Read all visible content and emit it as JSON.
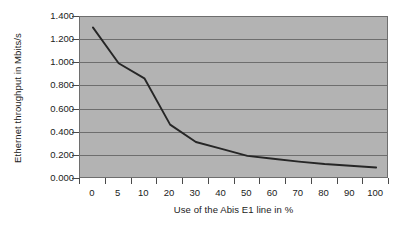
{
  "chart_data": {
    "type": "line",
    "title": "",
    "xlabel": "Use of the Abis E1 line in %",
    "ylabel": "Ethernet throughput in Mbits/s",
    "categories": [
      "0",
      "5",
      "10",
      "20",
      "30",
      "40",
      "50",
      "60",
      "70",
      "80",
      "90",
      "100"
    ],
    "series": [
      {
        "name": "Ethernet throughput",
        "values": [
          1.31,
          1.0,
          0.87,
          0.47,
          0.32,
          0.26,
          0.2,
          0.175,
          0.15,
          0.13,
          0.115,
          0.1
        ]
      }
    ],
    "x_tick_labels": [
      "0",
      "5",
      "10",
      "20",
      "30",
      "40",
      "50",
      "60",
      "70",
      "80",
      "90",
      "100"
    ],
    "y_tick_labels": [
      "0.000",
      "0.200",
      "0.400",
      "0.600",
      "0.800",
      "1.000",
      "1.200",
      "1.400"
    ],
    "y_tick_values": [
      0.0,
      0.2,
      0.4,
      0.6,
      0.8,
      1.0,
      1.2,
      1.4
    ],
    "ylim": [
      0.0,
      1.4
    ],
    "grid": "horizontal",
    "legend": "none",
    "colors": {
      "plot_background": "#b3b3b3",
      "page_background": "#ffffff",
      "gridline": "#6e6e6e",
      "axis": "#4a4a4a",
      "line": "#262626",
      "text": "#1b1b1b"
    }
  }
}
